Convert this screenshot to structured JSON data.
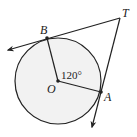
{
  "diagram": {
    "type": "geometry",
    "colors": {
      "stroke": "#222222",
      "circle_fill": "#f2f2f2",
      "background": "#ffffff"
    },
    "circle": {
      "center_label": "O",
      "cx": 58,
      "cy": 81,
      "r": 43
    },
    "points": {
      "O": {
        "label": "O",
        "x": 58,
        "y": 81
      },
      "B": {
        "label": "B",
        "x": 47,
        "y": 38
      },
      "A": {
        "label": "A",
        "x": 101,
        "y": 92
      },
      "T": {
        "label": "T",
        "x": 120,
        "y": 18
      }
    },
    "angle_label": "120°",
    "segments": [
      {
        "from": "O",
        "to": "B",
        "name": "radius-OB"
      },
      {
        "from": "O",
        "to": "A",
        "name": "radius-OA"
      }
    ],
    "rays": [
      {
        "from": "T",
        "through": "B",
        "name": "tangent-TB",
        "arrow_end": {
          "x": 7,
          "y": 50
        }
      },
      {
        "from": "T",
        "through": "A",
        "name": "tangent-TA",
        "arrow_end": {
          "x": 92,
          "y": 128
        }
      }
    ]
  }
}
